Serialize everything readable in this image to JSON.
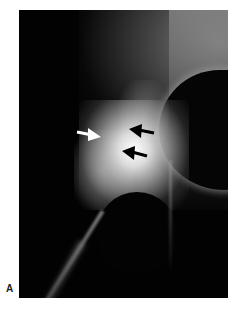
{
  "figure": {
    "panel_label": "A",
    "arrows": [
      {
        "color": "#ffffff",
        "direction": "right",
        "label": "white-arrow"
      },
      {
        "color": "#000000",
        "direction": "left",
        "label": "black-arrow-upper"
      },
      {
        "color": "#000000",
        "direction": "left",
        "label": "black-arrow-lower"
      }
    ]
  }
}
